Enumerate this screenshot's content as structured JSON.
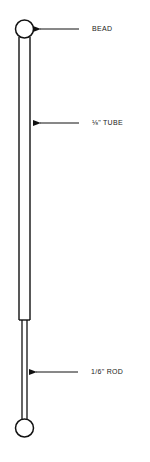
{
  "diagram": {
    "labels": {
      "bead": "BEAD",
      "tube": "⅛\" TUBE",
      "rod": "1/6\" ROD"
    },
    "colors": {
      "stroke": "#111111",
      "background": "#ffffff"
    }
  }
}
